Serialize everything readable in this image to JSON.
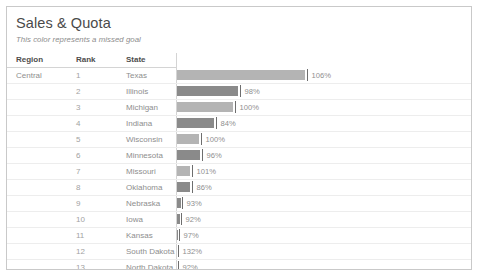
{
  "viz": {
    "title": "Sales & Quota",
    "subtitle": "This color represents a missed goal"
  },
  "columns": {
    "region": "Region",
    "rank": "Rank",
    "state": "State",
    "bar": ""
  },
  "colors": {
    "met": "#b4b4b4",
    "missed": "#8a8a8a",
    "tick": "#6e6e6e",
    "border": "#c9c9c9",
    "gridline": "#ededed",
    "header_text": "#4d4d4d",
    "body_text": "#9a9a9a",
    "title_text": "#4a4a4a",
    "subtitle_text": "#8c8c8c"
  },
  "chart_data": {
    "type": "bar",
    "title": "Sales & Quota",
    "subtitle": "This color represents a missed goal",
    "xlabel": "",
    "ylabel": "",
    "grid": true,
    "legend": "none",
    "orientation": "horizontal",
    "value_suffix": "%",
    "reference_line": 100,
    "columns": [
      "Region",
      "Rank",
      "State",
      "% of Quota"
    ],
    "rows": [
      {
        "region": "Central",
        "region_start": true,
        "rank": "1",
        "state": "Texas",
        "label": "106%",
        "value": 106,
        "bar_px": 128,
        "tick_px": 130,
        "met": true
      },
      {
        "region": "",
        "region_start": false,
        "rank": "2",
        "state": "Illinois",
        "label": "98%",
        "value": 98,
        "bar_px": 61,
        "tick_px": 63,
        "met": false
      },
      {
        "region": "",
        "region_start": false,
        "rank": "3",
        "state": "Michigan",
        "label": "100%",
        "value": 100,
        "bar_px": 56,
        "tick_px": 58,
        "met": true
      },
      {
        "region": "",
        "region_start": false,
        "rank": "4",
        "state": "Indiana",
        "label": "84%",
        "value": 84,
        "bar_px": 37,
        "tick_px": 39,
        "met": false
      },
      {
        "region": "",
        "region_start": false,
        "rank": "5",
        "state": "Wisconsin",
        "label": "100%",
        "value": 100,
        "bar_px": 22,
        "tick_px": 24,
        "met": true
      },
      {
        "region": "",
        "region_start": false,
        "rank": "6",
        "state": "Minnesota",
        "label": "96%",
        "value": 96,
        "bar_px": 23,
        "tick_px": 25,
        "met": false
      },
      {
        "region": "",
        "region_start": false,
        "rank": "7",
        "state": "Missouri",
        "label": "101%",
        "value": 101,
        "bar_px": 13,
        "tick_px": 15,
        "met": true
      },
      {
        "region": "",
        "region_start": false,
        "rank": "8",
        "state": "Oklahoma",
        "label": "86%",
        "value": 86,
        "bar_px": 13,
        "tick_px": 15,
        "met": false
      },
      {
        "region": "",
        "region_start": false,
        "rank": "9",
        "state": "Nebraska",
        "label": "93%",
        "value": 93,
        "bar_px": 4,
        "tick_px": 5,
        "met": false
      },
      {
        "region": "",
        "region_start": false,
        "rank": "10",
        "state": "Iowa",
        "label": "92%",
        "value": 92,
        "bar_px": 3,
        "tick_px": 4,
        "met": false
      },
      {
        "region": "",
        "region_start": false,
        "rank": "11",
        "state": "Kansas",
        "label": "97%",
        "value": 97,
        "bar_px": 1,
        "tick_px": 2,
        "met": false
      },
      {
        "region": "",
        "region_start": false,
        "rank": "12",
        "state": "South Dakota",
        "label": "132%",
        "value": 132,
        "bar_px": 0,
        "tick_px": 1,
        "met": true
      },
      {
        "region": "",
        "region_start": false,
        "rank": "13",
        "state": "North Dakota",
        "label": "92%",
        "value": 92,
        "bar_px": 0,
        "tick_px": 1,
        "met": false
      },
      {
        "region": "East",
        "region_start": true,
        "rank": "1",
        "state": "New York",
        "label": "100%",
        "value": 100,
        "bar_px": 240,
        "tick_px": 242,
        "met": true
      },
      {
        "region": "",
        "region_start": false,
        "rank": "2",
        "state": "Pennsylvania",
        "label": "92%",
        "value": 92,
        "bar_px": 90,
        "tick_px": 92,
        "met": false
      },
      {
        "region": "",
        "region_start": false,
        "rank": "3",
        "state": "Ohio",
        "label": "94%",
        "value": 94,
        "bar_px": 64,
        "tick_px": 66,
        "met": false
      },
      {
        "region": "",
        "region_start": false,
        "rank": "4",
        "state": "New Jersey",
        "label": "115%",
        "value": 115,
        "bar_px": 22,
        "tick_px": 24,
        "met": true
      }
    ]
  }
}
